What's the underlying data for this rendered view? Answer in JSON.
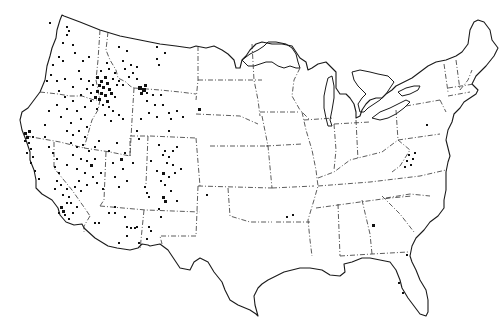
{
  "map": {
    "subject": "Continental United States point distribution map",
    "style": "black and white outline map with dash-dot state boundaries",
    "colors": {
      "background": "#ffffff",
      "lines": "#1a1a1a",
      "dots": "#111111"
    },
    "dot_clusters": [
      {
        "region": "central Idaho",
        "density": "very high"
      },
      {
        "region": "southwest Montana",
        "density": "high"
      },
      {
        "region": "northwest Wyoming",
        "density": "high"
      },
      {
        "region": "northern California coast",
        "density": "high"
      },
      {
        "region": "Nevada",
        "density": "moderate"
      },
      {
        "region": "eastern Oregon",
        "density": "moderate"
      },
      {
        "region": "western Colorado",
        "density": "moderate"
      },
      {
        "region": "northern New Mexico",
        "density": "moderate"
      },
      {
        "region": "southern California",
        "density": "moderate"
      },
      {
        "region": "southeastern Arizona",
        "density": "low"
      },
      {
        "region": "Washington",
        "density": "low"
      },
      {
        "region": "Utah",
        "density": "low"
      },
      {
        "region": "Virginia / West Virginia",
        "density": "low"
      },
      {
        "region": "Arkansas",
        "density": "sparse"
      },
      {
        "region": "Georgia",
        "density": "sparse"
      },
      {
        "region": "Florida",
        "density": "sparse"
      },
      {
        "region": "South Dakota",
        "density": "sparse"
      },
      {
        "region": "Oklahoma panhandle",
        "density": "sparse"
      }
    ]
  }
}
